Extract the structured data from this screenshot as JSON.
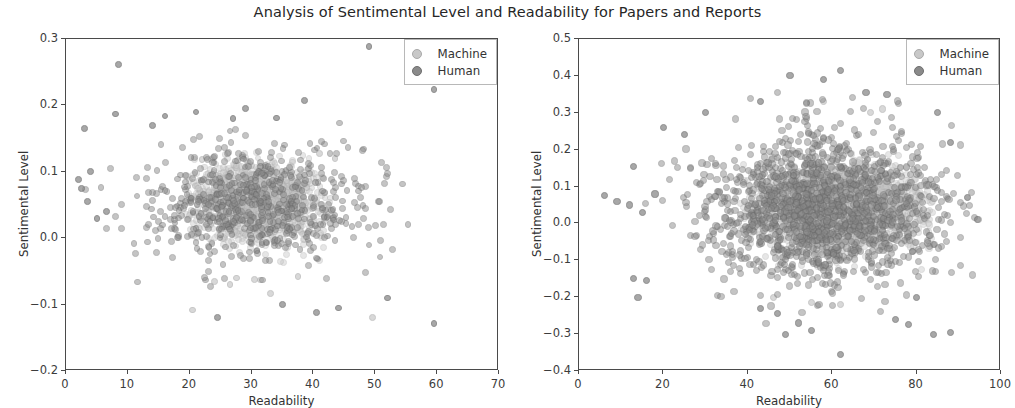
{
  "figure": {
    "title": "Analysis of Sentimental Level and Readability for Papers and Reports",
    "background": "#ffffff",
    "width": 1015,
    "height": 408
  },
  "legend": {
    "machine_label": "Machine",
    "human_label": "Human",
    "machine_color": "#c8c8c8",
    "human_color": "#8a8a8a",
    "position": "upper right"
  },
  "chart_data": [
    {
      "type": "scatter",
      "panel": "left",
      "title": "",
      "xlabel": "Readability",
      "ylabel": "Sentimental Level",
      "xlim": [
        0,
        70
      ],
      "ylim": [
        -0.2,
        0.3
      ],
      "xticks": [
        0,
        10,
        20,
        30,
        40,
        50,
        60,
        70
      ],
      "yticks": [
        0.3,
        0.2,
        0.1,
        0.0,
        -0.1,
        -0.2
      ],
      "xticklabels": [
        "0",
        "10",
        "20",
        "30",
        "40",
        "50",
        "60",
        "70"
      ],
      "yticklabels": [
        "0.3",
        "0.2",
        "0.1",
        "0.0",
        "-0.1",
        "-0.2"
      ],
      "grid": false,
      "legend_entries": [
        "Machine",
        "Human"
      ],
      "series": [
        {
          "name": "Machine",
          "color": "#c8c8c8",
          "marker": "o",
          "alpha": 0.45,
          "n_points": 1400,
          "cluster_x_mean": 31.0,
          "cluster_x_std": 5.4,
          "cluster_y_mean": 0.055,
          "cluster_y_std": 0.028,
          "x_range": [
            19,
            43
          ],
          "y_range": [
            -0.04,
            0.135
          ],
          "outlier_points": [
            [
              20.5,
              -0.108
            ],
            [
              24.0,
              -0.065
            ],
            [
              26.5,
              -0.07
            ],
            [
              27.5,
              -0.06
            ],
            [
              30.5,
              -0.062
            ],
            [
              31.5,
              -0.063
            ],
            [
              33.0,
              -0.083
            ],
            [
              37.5,
              -0.058
            ],
            [
              49.5,
              -0.12
            ],
            [
              41.0,
              0.128
            ],
            [
              43.5,
              0.12
            ],
            [
              22.0,
              0.118
            ]
          ]
        },
        {
          "name": "Human",
          "color": "#8a8a8a",
          "marker": "o",
          "alpha": 0.5,
          "n_points": 620,
          "cluster_x_mean": 30.5,
          "cluster_x_std": 9.0,
          "cluster_y_mean": 0.05,
          "cluster_y_std": 0.045,
          "x_range": [
            2,
            60
          ],
          "y_range": [
            -0.13,
            0.29
          ],
          "outlier_points": [
            [
              8.5,
              0.262
            ],
            [
              49.0,
              0.289
            ],
            [
              59.5,
              0.224
            ],
            [
              3.0,
              0.165
            ],
            [
              8.0,
              0.187
            ],
            [
              14.0,
              0.17
            ],
            [
              16.0,
              0.184
            ],
            [
              21.0,
              0.19
            ],
            [
              29.0,
              0.195
            ],
            [
              27.0,
              0.18
            ],
            [
              34.0,
              0.181
            ],
            [
              38.5,
              0.207
            ],
            [
              2.0,
              0.088
            ],
            [
              2.5,
              0.075
            ],
            [
              3.5,
              0.055
            ],
            [
              5.0,
              0.03
            ],
            [
              4.0,
              0.1
            ],
            [
              6.5,
              0.04
            ],
            [
              59.5,
              -0.128
            ],
            [
              52.0,
              -0.09
            ],
            [
              44.0,
              -0.105
            ],
            [
              40.5,
              -0.112
            ],
            [
              35.0,
              -0.1
            ],
            [
              24.5,
              -0.12
            ]
          ]
        }
      ]
    },
    {
      "type": "scatter",
      "panel": "right",
      "title": "",
      "xlabel": "Readability",
      "ylabel": "Sentimental Level",
      "xlim": [
        0,
        100
      ],
      "ylim": [
        -0.4,
        0.5
      ],
      "xticks": [
        0,
        20,
        40,
        60,
        80,
        100
      ],
      "yticks": [
        0.5,
        0.4,
        0.3,
        0.2,
        0.1,
        0.0,
        -0.1,
        -0.2,
        -0.3,
        -0.4
      ],
      "xticklabels": [
        "0",
        "20",
        "40",
        "60",
        "80",
        "100"
      ],
      "yticklabels": [
        "0.5",
        "0.4",
        "0.3",
        "0.2",
        "0.1",
        "0.0",
        "-0.1",
        "-0.2",
        "-0.3",
        "-0.4"
      ],
      "grid": false,
      "legend_entries": [
        "Machine",
        "Human"
      ],
      "series": [
        {
          "name": "Machine",
          "color": "#c8c8c8",
          "marker": "o",
          "alpha": 0.45,
          "n_points": 2200,
          "cluster_x_mean": 62.0,
          "cluster_x_std": 9.5,
          "cluster_y_mean": 0.04,
          "cluster_y_std": 0.055,
          "x_range": [
            38,
            84
          ],
          "y_range": [
            -0.13,
            0.2
          ],
          "outlier_points": [
            [
              55.0,
              -0.215
            ],
            [
              62.0,
              -0.22
            ],
            [
              46.0,
              -0.2
            ],
            [
              69.0,
              0.3
            ],
            [
              72.0,
              0.31
            ],
            [
              58.0,
              0.33
            ]
          ]
        },
        {
          "name": "Human",
          "color": "#8a8a8a",
          "marker": "o",
          "alpha": 0.5,
          "n_points": 1500,
          "cluster_x_mean": 58.0,
          "cluster_x_std": 13.5,
          "cluster_y_mean": 0.04,
          "cluster_y_std": 0.1,
          "x_range": [
            10,
            95
          ],
          "y_range": [
            -0.36,
            0.42
          ],
          "outlier_points": [
            [
              62.0,
              0.415
            ],
            [
              50.0,
              0.4
            ],
            [
              58.0,
              0.39
            ],
            [
              68.0,
              0.355
            ],
            [
              73.0,
              0.35
            ],
            [
              43.0,
              0.33
            ],
            [
              20.0,
              0.26
            ],
            [
              25.0,
              0.24
            ],
            [
              30.0,
              0.3
            ],
            [
              85.0,
              0.3
            ],
            [
              88.0,
              0.22
            ],
            [
              92.0,
              0.07
            ],
            [
              6.0,
              0.075
            ],
            [
              9.0,
              0.06
            ],
            [
              12.0,
              0.05
            ],
            [
              15.0,
              0.03
            ],
            [
              13.0,
              0.155
            ],
            [
              18.0,
              0.08
            ],
            [
              13.0,
              -0.15
            ],
            [
              16.0,
              -0.155
            ],
            [
              14.0,
              -0.2
            ],
            [
              43.0,
              -0.23
            ],
            [
              47.0,
              -0.245
            ],
            [
              52.0,
              -0.27
            ],
            [
              49.0,
              -0.3
            ],
            [
              55.0,
              -0.29
            ],
            [
              62.0,
              -0.355
            ],
            [
              75.0,
              -0.26
            ],
            [
              78.0,
              -0.275
            ],
            [
              84.0,
              -0.3
            ],
            [
              88.0,
              -0.295
            ],
            [
              80.0,
              -0.2
            ]
          ]
        }
      ]
    }
  ]
}
